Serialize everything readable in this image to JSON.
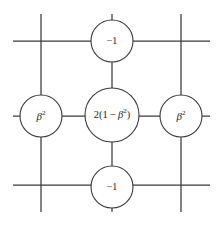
{
  "figure": {
    "name": "finite-difference-stencil",
    "background_color": "#ffffff",
    "line_color": "#3a3a3a",
    "text_color": "#1d1d1d"
  },
  "nodes": {
    "center": {
      "label_plain": "2(1-β²)",
      "coefficient": "2",
      "open_paren": "(1 − ",
      "beta": "β",
      "exponent": "2",
      "close_paren": ")",
      "cx": 112,
      "cy": 115,
      "r": 27
    },
    "top": {
      "label_plain": "−1",
      "cx": 112,
      "cy": 41,
      "r": 21
    },
    "bottom": {
      "label_plain": "−1",
      "cx": 112,
      "cy": 187,
      "r": 21
    },
    "left": {
      "beta": "β",
      "exponent": "2",
      "label_plain": "β²",
      "cx": 41,
      "cy": 116,
      "r": 21
    },
    "right": {
      "beta": "β",
      "exponent": "2",
      "label_plain": "β²",
      "cx": 181,
      "cy": 116,
      "r": 21
    }
  },
  "grid": {
    "horizontal_lines": [
      {
        "name": "upper-horizontal-grid-line",
        "x1": 13,
        "y1": 41,
        "x2": 210,
        "y2": 41
      },
      {
        "name": "middle-horizontal-grid-line",
        "x1": 13,
        "y1": 116,
        "x2": 210,
        "y2": 116
      },
      {
        "name": "lower-horizontal-grid-line",
        "x1": 13,
        "y1": 185,
        "x2": 210,
        "y2": 185
      }
    ],
    "vertical_lines": [
      {
        "name": "left-vertical-grid-line",
        "x1": 41,
        "y1": 14,
        "x2": 41,
        "y2": 212
      },
      {
        "name": "middle-vertical-grid-line",
        "x1": 112,
        "y1": 14,
        "x2": 112,
        "y2": 212
      },
      {
        "name": "right-vertical-grid-line",
        "x1": 181,
        "y1": 14,
        "x2": 181,
        "y2": 212
      }
    ],
    "intersections": [
      {
        "name": "upper-left-intersection",
        "x": 41,
        "y": 41
      },
      {
        "name": "upper-right-intersection",
        "x": 181,
        "y": 41
      },
      {
        "name": "lower-left-intersection",
        "x": 41,
        "y": 185
      },
      {
        "name": "lower-right-intersection",
        "x": 181,
        "y": 185
      }
    ]
  }
}
